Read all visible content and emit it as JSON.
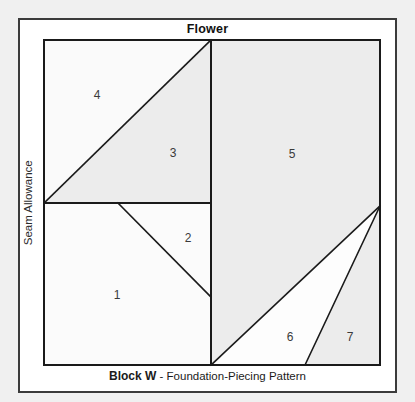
{
  "title": "Flower",
  "caption": {
    "block": "Block W",
    "rest": " - Foundation-Piecing Pattern"
  },
  "seam_allowance_label": "Seam Allowance",
  "colors": {
    "page_background": "#f0f0f0",
    "card_background": "#ffffff",
    "frame_border": "#3b3b3b",
    "block_border": "#3b3b3b",
    "line": "#1a1a1a",
    "fill_light": "#fafafa",
    "fill_medium": "#ededed",
    "fill_white": "#ffffff",
    "label_text": "#3a3a3a",
    "title_text": "#111111"
  },
  "block": {
    "x": 44,
    "y": 40,
    "width": 336,
    "height": 325
  },
  "pieces": [
    {
      "number": "1",
      "label_x": 117,
      "label_y": 295,
      "fill": "#fbfbfb",
      "points": "44,203 118,203 211,297 211,365 44,365"
    },
    {
      "number": "2",
      "label_x": 188,
      "label_y": 238,
      "fill": "#fbfbfb",
      "points": "118,203 211,203 211,297"
    },
    {
      "number": "3",
      "label_x": 173,
      "label_y": 153,
      "fill": "#ececec",
      "points": "44,203 211,40 211,203"
    },
    {
      "number": "4",
      "label_x": 97,
      "label_y": 95,
      "fill": "#fafafa",
      "points": "44,40 211,40 44,203"
    },
    {
      "number": "5",
      "label_x": 292,
      "label_y": 154,
      "fill": "#ececec",
      "points": "211,40 380,40 380,206 211,365"
    },
    {
      "number": "6",
      "label_x": 290,
      "label_y": 337,
      "fill": "#fdfdfd",
      "points": "211,365 380,206 305,365"
    },
    {
      "number": "7",
      "label_x": 350,
      "label_y": 337,
      "fill": "#ececec",
      "points": "305,365 380,206 380,365"
    }
  ],
  "lines": [
    {
      "name": "block-outline",
      "points": "44,40 380,40 380,365 44,365 44,40",
      "width": 2
    },
    {
      "name": "center-vertical",
      "points": "211,40 211,365",
      "width": 2
    },
    {
      "name": "horizontal-left",
      "points": "44,203 211,203",
      "width": 2
    },
    {
      "name": "diagonal-4-3",
      "points": "44,203 211,40",
      "width": 1.6
    },
    {
      "name": "diagonal-1-2",
      "points": "118,203 211,297",
      "width": 1.6
    },
    {
      "name": "diagonal-5-6",
      "points": "211,365 380,206",
      "width": 1.6
    },
    {
      "name": "diagonal-6-7",
      "points": "305,365 380,206",
      "width": 1.6
    }
  ]
}
